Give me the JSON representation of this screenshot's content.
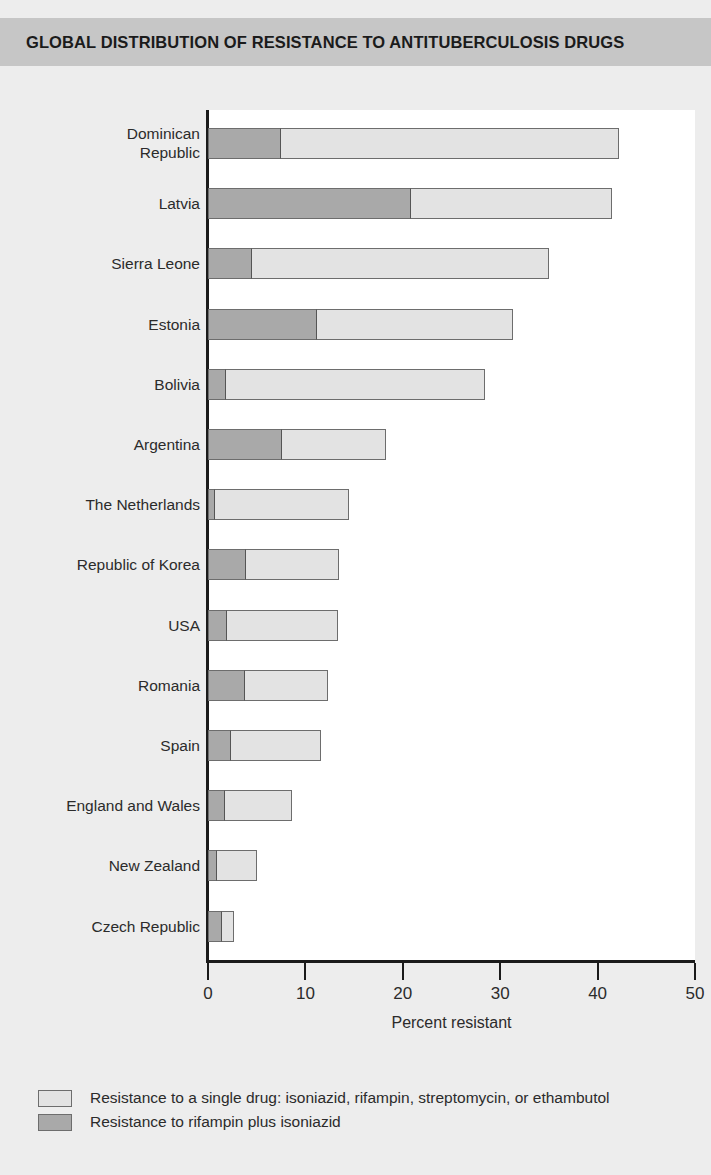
{
  "title": "GLOBAL DISTRIBUTION OF RESISTANCE TO ANTITUBERCULOSIS DRUGS",
  "colors": {
    "banner": "#c6c6c6",
    "background": "#ededed",
    "plot_area": "#ffffff",
    "single_drug": "#e3e3e3",
    "rifampin_plus_isoniazid": "#a9a9a9",
    "axis": "#1b1b1b"
  },
  "legend": {
    "position": "below-axis",
    "items": [
      {
        "swatch": "single_drug",
        "label": "Resistance to a single drug: isoniazid, rifampin, streptomycin, or ethambutol"
      },
      {
        "swatch": "rifampin_plus_isoniazid",
        "label": "Resistance to rifampin plus isoniazid"
      }
    ]
  },
  "chart_data": {
    "type": "bar",
    "orientation": "horizontal",
    "stacked": true,
    "title": "GLOBAL DISTRIBUTION OF RESISTANCE TO ANTITUBERCULOSIS DRUGS",
    "xlabel": "Percent resistant",
    "ylabel": "",
    "xlim": [
      0,
      50
    ],
    "xticks": [
      0,
      10,
      20,
      30,
      40,
      50
    ],
    "xtick_labels": [
      "0",
      "10",
      "20",
      "30",
      "40",
      "50"
    ],
    "grid": false,
    "legend_position": "bottom-left",
    "categories": [
      "Dominican Republic",
      "Latvia",
      "Sierra Leone",
      "Estonia",
      "Bolivia",
      "Argentina",
      "The Netherlands",
      "Republic of Korea",
      "USA",
      "Romania",
      "Spain",
      "England and Wales",
      "New Zealand",
      "Czech Republic"
    ],
    "series": [
      {
        "name": "Resistance to rifampin plus isoniazid",
        "color": "#a9a9a9",
        "values": [
          7.5,
          20.8,
          4.5,
          11.2,
          1.8,
          7.6,
          0.7,
          3.9,
          1.9,
          3.8,
          2.4,
          1.7,
          0.9,
          1.4
        ]
      },
      {
        "name": "Resistance to a single drug: isoniazid, rifampin, streptomycin, or ethambutol",
        "color": "#e3e3e3",
        "values": [
          34.7,
          20.7,
          30.5,
          20.1,
          26.6,
          10.7,
          13.8,
          9.5,
          11.4,
          8.5,
          9.2,
          6.9,
          4.1,
          1.3
        ]
      }
    ],
    "totals": [
      42.2,
      41.5,
      35.0,
      31.3,
      28.4,
      18.3,
      14.5,
      13.4,
      13.3,
      12.3,
      11.6,
      8.6,
      5.0,
      2.7
    ]
  }
}
